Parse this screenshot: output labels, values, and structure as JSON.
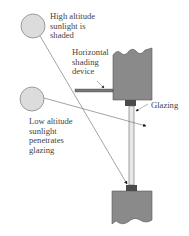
{
  "diagram": {
    "labels": {
      "high_sun": [
        "High altitude",
        "sunlight is",
        "shaded"
      ],
      "shading_device": [
        "Horizontal",
        "shading",
        "device"
      ],
      "glazing": "Glazing",
      "low_sun": [
        "Low altitude",
        "sunlight",
        "penetrates",
        "glazing"
      ]
    },
    "colors": {
      "sun_fill": "#dcdcdc",
      "wall_fill": "#8a8a8a",
      "frame_fill": "#4a4a4a",
      "line": "#555555",
      "text": "#444444"
    }
  }
}
